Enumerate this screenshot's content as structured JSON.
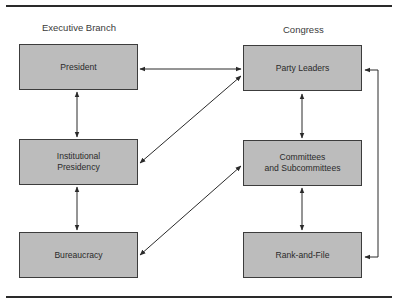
{
  "diagram": {
    "columns": {
      "executive": {
        "title": "Executive Branch"
      },
      "congress": {
        "title": "Congress"
      }
    },
    "nodes": {
      "president": {
        "label": "President"
      },
      "institutional_presidency": {
        "label": "Institutional\nPresidency"
      },
      "bureaucracy": {
        "label": "Bureaucracy"
      },
      "party_leaders": {
        "label": "Party Leaders"
      },
      "committees": {
        "label": "Committees\nand Subcommittees"
      },
      "rank_and_file": {
        "label": "Rank-and-File"
      }
    },
    "edges": [
      {
        "from": "President",
        "to": "Party Leaders",
        "direction": "both"
      },
      {
        "from": "President",
        "to": "Institutional Presidency",
        "direction": "both"
      },
      {
        "from": "Institutional Presidency",
        "to": "Bureaucracy",
        "direction": "both"
      },
      {
        "from": "Institutional Presidency",
        "to": "Party Leaders",
        "direction": "both"
      },
      {
        "from": "Bureaucracy",
        "to": "Committees and Subcommittees",
        "direction": "both"
      },
      {
        "from": "Party Leaders",
        "to": "Committees and Subcommittees",
        "direction": "both"
      },
      {
        "from": "Committees and Subcommittees",
        "to": "Rank-and-File",
        "direction": "both"
      },
      {
        "from": "Party Leaders",
        "to": "Rank-and-File",
        "direction": "both",
        "route": "right-bracket"
      }
    ],
    "colors": {
      "box_fill": "#bcbcbc",
      "box_border": "#3c3c3c",
      "line": "#2a2a2a",
      "text": "#2e2e2e"
    }
  }
}
